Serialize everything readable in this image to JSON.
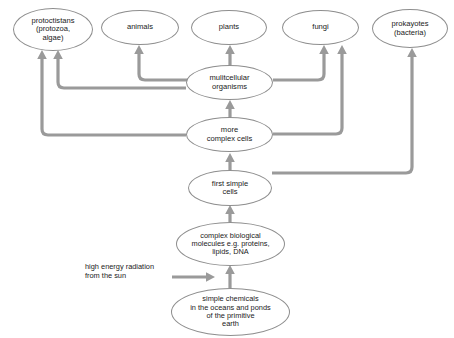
{
  "diagram": {
    "background_color": "#ffffff",
    "node_border_color": "#8e8e8e",
    "node_fill_color": "#ffffff",
    "arrow_color": "#9a9a9a",
    "text_color": "#1a1a1a",
    "nodes": [
      {
        "id": "protoctistans",
        "label": "protoctistans\n(protozoa,\nalgae)",
        "x": 13,
        "y": 8,
        "w": 80,
        "h": 43,
        "font_size": 7.6
      },
      {
        "id": "animals",
        "label": "animals",
        "x": 101,
        "y": 10,
        "w": 78,
        "h": 35,
        "font_size": 7.6
      },
      {
        "id": "plants",
        "label": "plants",
        "x": 191,
        "y": 10,
        "w": 76,
        "h": 35,
        "font_size": 7.6
      },
      {
        "id": "fungi",
        "label": "fungi",
        "x": 282,
        "y": 10,
        "w": 77,
        "h": 35,
        "font_size": 7.6
      },
      {
        "id": "prokaryotes",
        "label": "prokayotes\n(bacteria)",
        "x": 372,
        "y": 9,
        "w": 76,
        "h": 39,
        "font_size": 7.6
      },
      {
        "id": "multicellular",
        "label": "mulitcellular\norganisms",
        "x": 186,
        "y": 65,
        "w": 87,
        "h": 35,
        "font_size": 7.6
      },
      {
        "id": "more-complex-cells",
        "label": "more\ncomplex cells",
        "x": 186,
        "y": 117,
        "w": 87,
        "h": 35,
        "font_size": 7.6
      },
      {
        "id": "first-simple-cells",
        "label": "first simple\ncells",
        "x": 188,
        "y": 170,
        "w": 84,
        "h": 36,
        "font_size": 7.6
      },
      {
        "id": "complex-molecules",
        "label": "complex biological\nmolecules e.g. proteins,\nlipids, DNA",
        "x": 176,
        "y": 222,
        "w": 109,
        "h": 44,
        "font_size": 7.4
      },
      {
        "id": "simple-chemicals",
        "label": "simple chemicals\nin the oceans and ponds\nof the primitive\nearth",
        "x": 171,
        "y": 288,
        "w": 119,
        "h": 48,
        "font_size": 7.4
      }
    ],
    "labels": [
      {
        "id": "sun-radiation",
        "text": "high energy radiation\nfrom the sun",
        "x": 85,
        "y": 262,
        "font_size": 7.4
      }
    ],
    "arrows": [
      {
        "id": "chemicals-to-molecules",
        "from": "simple-chemicals",
        "to": "complex-molecules"
      },
      {
        "id": "molecules-to-first-cells",
        "from": "complex-molecules",
        "to": "first-simple-cells"
      },
      {
        "id": "first-cells-to-complex-cells",
        "from": "first-simple-cells",
        "to": "more-complex-cells"
      },
      {
        "id": "complex-cells-to-multicellular",
        "from": "more-complex-cells",
        "to": "multicellular"
      },
      {
        "id": "multicellular-to-plants",
        "from": "multicellular",
        "to": "plants"
      },
      {
        "id": "multicellular-to-animals",
        "from": "multicellular",
        "to": "animals"
      },
      {
        "id": "multicellular-to-protoctistans",
        "from": "multicellular",
        "to": "protoctistans"
      },
      {
        "id": "multicellular-to-fungi",
        "from": "multicellular",
        "to": "fungi"
      },
      {
        "id": "complex-cells-to-protoctistans",
        "from": "more-complex-cells",
        "to": "protoctistans"
      },
      {
        "id": "complex-cells-to-fungi",
        "from": "more-complex-cells",
        "to": "fungi"
      },
      {
        "id": "first-cells-to-prokaryotes",
        "from": "first-simple-cells",
        "to": "prokaryotes"
      },
      {
        "id": "sun-to-chemicals",
        "from": "sun-radiation",
        "to": "simple-chemicals"
      }
    ]
  }
}
